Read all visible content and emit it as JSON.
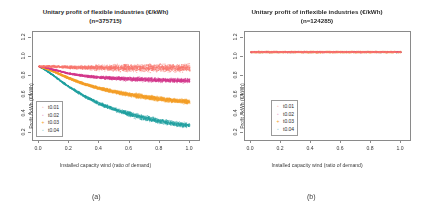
{
  "figure": {
    "panels": [
      {
        "caption": "(a)",
        "title_line1": "Unitary profit of flexible industries  (€/kWh)",
        "title_line2": "(n=375715)",
        "chart_data": {
          "type": "scatter",
          "title": "Unitary profit of flexible industries  (€/kWh) (n=375715)",
          "xlabel": "Installed capacity wind (ratio of demand)",
          "ylabel": "Profit / kWh  (€/kWh)",
          "xlim": [
            -0.04,
            1.06
          ],
          "ylim": [
            0.13,
            1.26
          ],
          "xticks": [
            "0.0",
            "0.2",
            "0.4",
            "0.6",
            "0.8",
            "1.0"
          ],
          "xtickvals": [
            0.0,
            0.2,
            0.4,
            0.6,
            0.8,
            1.0
          ],
          "yticks": [
            "0.2",
            "0.4",
            "0.6",
            "0.8",
            "1.0",
            "1.2"
          ],
          "ytickvals": [
            0.2,
            0.4,
            0.6,
            0.8,
            1.0,
            1.2
          ],
          "grid": false,
          "legend_position": "bottom-left",
          "series": [
            {
              "name": "t0.01",
              "color": "#F8766D",
              "symbol": "circle",
              "x": [
                0.0,
                0.05,
                0.1,
                0.15,
                0.2,
                0.3,
                0.4,
                0.5,
                0.6,
                0.7,
                0.8,
                0.9,
                1.0
              ],
              "values": [
                0.9,
                0.9,
                0.9,
                0.895,
                0.89,
                0.89,
                0.885,
                0.885,
                0.885,
                0.885,
                0.885,
                0.885,
                0.885
              ],
              "spread": 0.055
            },
            {
              "name": "t0.02",
              "color": "#D4398C",
              "symbol": "circle",
              "x": [
                0.0,
                0.05,
                0.1,
                0.15,
                0.2,
                0.3,
                0.4,
                0.5,
                0.6,
                0.7,
                0.8,
                0.9,
                1.0
              ],
              "values": [
                0.9,
                0.885,
                0.865,
                0.845,
                0.825,
                0.8,
                0.785,
                0.775,
                0.768,
                0.762,
                0.757,
                0.753,
                0.75
              ],
              "spread": 0.03
            },
            {
              "name": "t0.03",
              "color": "#F5A02A",
              "symbol": "plus",
              "x": [
                0.0,
                0.05,
                0.1,
                0.15,
                0.2,
                0.3,
                0.4,
                0.5,
                0.6,
                0.7,
                0.8,
                0.9,
                1.0
              ],
              "values": [
                0.9,
                0.875,
                0.845,
                0.81,
                0.775,
                0.715,
                0.67,
                0.635,
                0.605,
                0.58,
                0.56,
                0.542,
                0.528
              ],
              "spread": 0.03
            },
            {
              "name": "t0.04",
              "color": "#21A0A0",
              "symbol": "circle",
              "x": [
                0.0,
                0.05,
                0.1,
                0.15,
                0.2,
                0.3,
                0.4,
                0.5,
                0.6,
                0.7,
                0.8,
                0.9,
                1.0
              ],
              "values": [
                0.9,
                0.855,
                0.8,
                0.74,
                0.685,
                0.59,
                0.51,
                0.45,
                0.4,
                0.36,
                0.327,
                0.3,
                0.28
              ],
              "spread": 0.035
            }
          ]
        },
        "legend": [
          {
            "label": "t0.01",
            "color": "#F8766D",
            "symbol": "◦"
          },
          {
            "label": "t0.02",
            "color": "#D4398C",
            "symbol": "◦"
          },
          {
            "label": "t0.03",
            "color": "#F5A02A",
            "symbol": "+"
          },
          {
            "label": "t0.04",
            "color": "#21A0A0",
            "symbol": "◦"
          }
        ]
      },
      {
        "caption": "(b)",
        "title_line1": "Unitary profit of inflexible industries (€/kWh)",
        "title_line2": "(n=124285)",
        "chart_data": {
          "type": "scatter",
          "title": "Unitary profit of inflexible industries (€/kWh) (n=124285)",
          "xlabel": "Installed capacity wind (ratio of demand)",
          "ylabel": "Profit / kWh  (€/kWh)",
          "xlim": [
            -0.04,
            1.06
          ],
          "ylim": [
            0.13,
            1.26
          ],
          "xticks": [
            "0.0",
            "0.2",
            "0.4",
            "0.6",
            "0.8",
            "1.0"
          ],
          "xtickvals": [
            0.0,
            0.2,
            0.4,
            0.6,
            0.8,
            1.0
          ],
          "yticks": [
            "0.2",
            "0.4",
            "0.6",
            "0.8",
            "1.0",
            "1.2"
          ],
          "ytickvals": [
            0.2,
            0.4,
            0.6,
            0.8,
            1.0,
            1.2
          ],
          "grid": false,
          "legend_position": "bottom-left",
          "series": [
            {
              "name": "t0.01",
              "color": "#F8766D",
              "symbol": "circle",
              "x": [
                0.0,
                0.2,
                0.4,
                0.6,
                0.8,
                1.0
              ],
              "values": [
                1.05,
                1.05,
                1.05,
                1.05,
                1.05,
                1.05
              ],
              "spread": 0.008
            },
            {
              "name": "t0.02",
              "color": "#D4398C",
              "symbol": "circle",
              "x": [
                0.0,
                0.2,
                0.4,
                0.6,
                0.8,
                1.0
              ],
              "values": [
                1.05,
                1.05,
                1.05,
                1.05,
                1.05,
                1.05
              ],
              "spread": 0.008
            },
            {
              "name": "t0.03",
              "color": "#F5A02A",
              "symbol": "plus",
              "x": [
                0.0,
                0.2,
                0.4,
                0.6,
                0.8,
                1.0
              ],
              "values": [
                1.05,
                1.05,
                1.05,
                1.05,
                1.05,
                1.05
              ],
              "spread": 0.008
            },
            {
              "name": "t0.04",
              "color": "#21A0A0",
              "symbol": "circle",
              "x": [
                0.0,
                0.2,
                0.4,
                0.6,
                0.8,
                1.0
              ],
              "values": [
                1.05,
                1.05,
                1.05,
                1.05,
                1.05,
                1.05
              ],
              "spread": 0.008
            }
          ]
        },
        "legend": [
          {
            "label": "t0.01",
            "color": "#F8766D",
            "symbol": "◦"
          },
          {
            "label": "t0.02",
            "color": "#D4398C",
            "symbol": "◦"
          },
          {
            "label": "t0.03",
            "color": "#F5A02A",
            "symbol": "+"
          },
          {
            "label": "t0.04",
            "color": "#21A0A0",
            "symbol": "◦"
          }
        ]
      }
    ]
  }
}
